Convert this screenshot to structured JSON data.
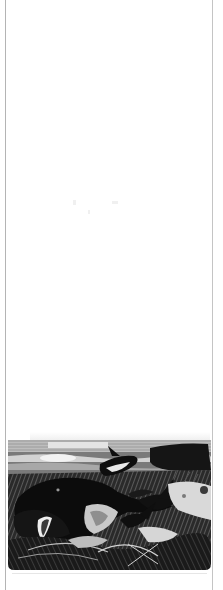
{
  "page": {
    "type": "scanned-book-page",
    "background": "#ffffff",
    "border_color": "#b4b4b4"
  },
  "illustration": {
    "subject": "engraving of killer whales (orcas) attacking a large whale in rough sea",
    "style": "black-and-white engraving",
    "colors": {
      "ink": "#111111",
      "mid": "#6a6a6a",
      "light": "#d8d8d8",
      "paper": "#ffffff"
    }
  }
}
